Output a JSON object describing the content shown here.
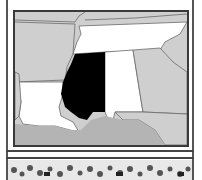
{
  "map": {
    "subject": "Mississippi highlighted",
    "highlighted_state": "Mississippi",
    "states_shown": [
      "Missouri",
      "Kentucky",
      "Tennessee",
      "Arkansas",
      "Mississippi",
      "Alabama",
      "Georgia",
      "Louisiana",
      "Texas",
      "Florida"
    ],
    "colors": {
      "highlight": "#000000",
      "neighbor_light": "#ffffff",
      "other_land": "#cfcfcf",
      "water": "#b4b4b4",
      "border": "#6a6a6a",
      "frame": "#3a3a3a"
    }
  },
  "decoration": {
    "bottom_strip": "floral-border"
  }
}
